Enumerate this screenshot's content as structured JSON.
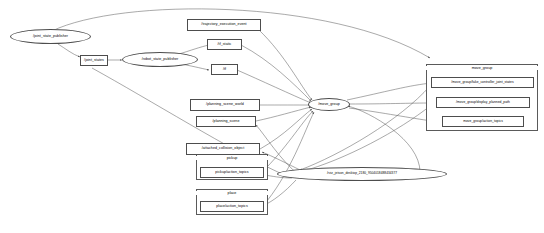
{
  "graph": {
    "title": "rqt_graph ROS computation graph",
    "background": "#ffffff",
    "edge_color": "#555555",
    "node_border": "#4d4d4d"
  },
  "nodes": {
    "joint_state_publisher": "/joint_state_publisher",
    "robot_state_publisher": "/robot_state_publisher",
    "move_group_node": "/move_group",
    "rviz": "/rviz_jetson_desktop_2180_9504018488434377"
  },
  "topics": {
    "joint_states": "/joint_states",
    "trajectory_execution_event": "/trajectory_execution_event",
    "tf_static": "/tf_static",
    "tf": "/tf",
    "planning_scene_world": "/planning_scene_world",
    "planning_scene": "/planning_scene",
    "attached_collision_object": "/attached_collision_object",
    "pickup_action_topics": "pickup/action_topics",
    "place_action_topics": "place/action_topics",
    "mg_fake_controller_joint_states": "/move_group/fake_controller_joint_states",
    "mg_display_planned_path": "/move_group/display_planned_path",
    "mg_action_topics": "move_group/action_topics"
  },
  "clusters": {
    "move_group": "move_group",
    "pickup": "pickup",
    "place": "place"
  }
}
